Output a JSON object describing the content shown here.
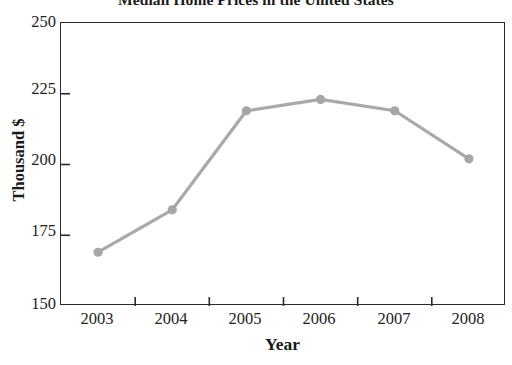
{
  "chart_data": {
    "type": "line",
    "title": "Median Home Prices in the United States",
    "xlabel": "Year",
    "ylabel": "Thousand $",
    "categories": [
      "2003",
      "2004",
      "2005",
      "2006",
      "2007",
      "2008"
    ],
    "values": [
      169,
      184,
      219,
      223,
      219,
      202
    ],
    "series": [
      {
        "name": "Median Home Price",
        "values": [
          169,
          184,
          219,
          223,
          219,
          202
        ]
      }
    ],
    "ylim": [
      150,
      250
    ],
    "y_ticks": [
      "150",
      "175",
      "200",
      "225",
      "250"
    ],
    "y_tick_values": [
      150,
      175,
      200,
      225,
      250
    ],
    "x_ticks": [
      "2003",
      "2004",
      "2005",
      "2006",
      "2007",
      "2008"
    ],
    "grid": false,
    "legend": "none",
    "line_color": "#a9a9a9",
    "marker_color": "#a6a6a6",
    "marker_shape": "circle",
    "axis_color": "#2b2b2b",
    "background_color": "#ffffff"
  }
}
